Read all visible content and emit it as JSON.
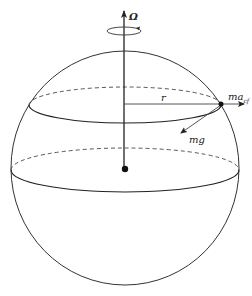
{
  "diagram": {
    "title": "",
    "colors": {
      "stroke": "#333333",
      "background": "#ffffff"
    },
    "labels": {
      "omega": "Ω",
      "radius": "r",
      "centrifugal_base": "ma",
      "centrifugal_sub": "cf",
      "gravity": "mg"
    },
    "elements": {
      "sphere": {
        "cx": 125,
        "cy": 168,
        "rx": 114,
        "ry": 117
      },
      "rotation_axis": {
        "x": 124,
        "y_top": 10,
        "y_bottom": 169
      },
      "rotation_indicator": {
        "cx": 124,
        "cy": 31,
        "rx": 17,
        "ry": 4
      },
      "upper_latitude": {
        "cx": 125,
        "cy": 105,
        "rx": 96,
        "ry": 18
      },
      "equator": {
        "cx": 125,
        "cy": 170,
        "rx": 114,
        "ry": 22
      },
      "center_point": {
        "x": 125,
        "y": 169
      },
      "mass_point": {
        "x": 221,
        "y": 104
      },
      "centrifugal_arrow": {
        "x1": 124,
        "y1": 104,
        "x2": 244,
        "y2": 104
      },
      "gravity_arrow": {
        "x1": 221,
        "y1": 105,
        "x2": 181,
        "y2": 133
      }
    }
  }
}
